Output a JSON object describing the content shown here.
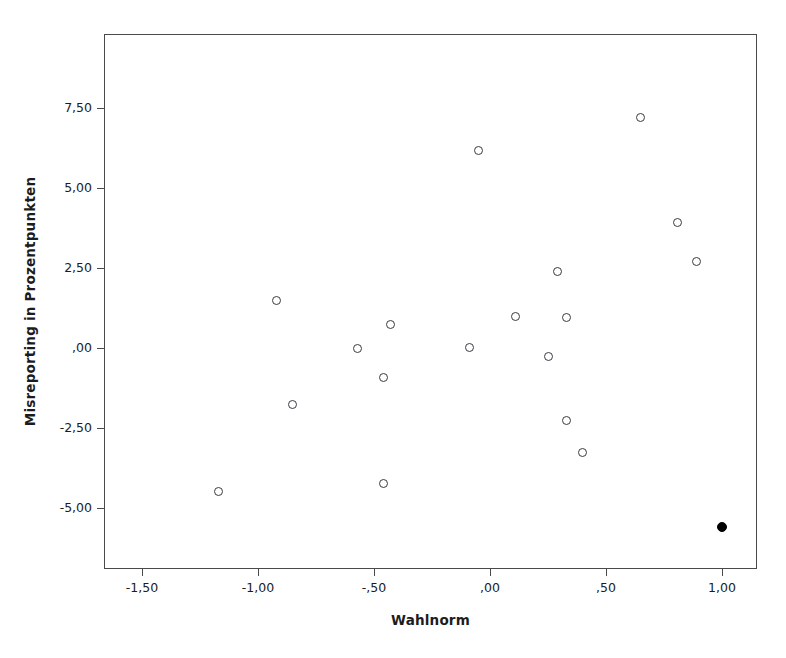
{
  "chart_data": {
    "type": "scatter",
    "title": "",
    "xlabel": "Wahlnorm",
    "ylabel": "Misreporting in Prozentpunkten",
    "xlim": [
      -1.63,
      1.15
    ],
    "ylim": [
      -6.8,
      8.6
    ],
    "grid": false,
    "legend": "none",
    "xticks": [
      -1.5,
      -1.0,
      -0.5,
      0.0,
      0.5,
      1.0
    ],
    "xtick_labels": [
      "-1,50",
      "-1,00",
      "-,50",
      ",00",
      ",50",
      "1,00"
    ],
    "yticks": [
      7.5,
      5.0,
      2.5,
      0.0,
      -2.5,
      -5.0
    ],
    "ytick_labels": [
      "7,50",
      "5,00",
      "2,50",
      ",00",
      "-2,50",
      "-5,00"
    ],
    "decimal_separator": ",",
    "marker_styles": {
      "open_circle": "hollow circle, dark gray outline",
      "filled_circle": "solid black circle"
    },
    "n_points": 21,
    "points": [
      {
        "x": -1.17,
        "y": -4.47,
        "style": "open_circle"
      },
      {
        "x": -0.92,
        "y": 1.5,
        "style": "open_circle"
      },
      {
        "x": -0.85,
        "y": -1.75,
        "style": "open_circle"
      },
      {
        "x": -0.57,
        "y": -0.03,
        "style": "open_circle"
      },
      {
        "x": -0.46,
        "y": -0.91,
        "style": "open_circle"
      },
      {
        "x": -0.43,
        "y": 0.72,
        "style": "open_circle"
      },
      {
        "x": -0.46,
        "y": -4.22,
        "style": "open_circle"
      },
      {
        "x": -0.09,
        "y": 0.03,
        "style": "open_circle"
      },
      {
        "x": -0.05,
        "y": 6.16,
        "style": "open_circle"
      },
      {
        "x": 0.11,
        "y": 0.97,
        "style": "open_circle"
      },
      {
        "x": 0.25,
        "y": -0.28,
        "style": "open_circle"
      },
      {
        "x": 0.29,
        "y": 2.38,
        "style": "open_circle"
      },
      {
        "x": 0.33,
        "y": 0.94,
        "style": "open_circle"
      },
      {
        "x": 0.33,
        "y": -2.25,
        "style": "open_circle"
      },
      {
        "x": 0.4,
        "y": -3.28,
        "style": "open_circle"
      },
      {
        "x": 0.65,
        "y": 7.19,
        "style": "open_circle"
      },
      {
        "x": 0.81,
        "y": 3.91,
        "style": "open_circle"
      },
      {
        "x": 0.89,
        "y": 2.69,
        "style": "open_circle"
      },
      {
        "x": 1.0,
        "y": -5.6,
        "style": "filled_circle"
      }
    ],
    "colors": {
      "marker_outline": "#3a3a42",
      "marker_filled": "#000000",
      "frame": "#4a4a4a",
      "text": "#1c1c1c",
      "background": "#ffffff"
    }
  }
}
